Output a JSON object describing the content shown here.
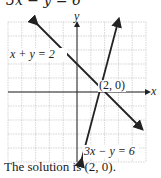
{
  "header": {
    "partial_equation": "3x − y = 6"
  },
  "caption": "The solution is (2, 0).",
  "chart_data": {
    "type": "line",
    "title": "",
    "xlabel": "x",
    "ylabel": "y",
    "xlim": [
      -5,
      5
    ],
    "ylim": [
      -5,
      5
    ],
    "grid": true,
    "series": [
      {
        "name": "x + y = 2",
        "x": [
          -3,
          4.5
        ],
        "y": [
          5,
          -2.5
        ]
      },
      {
        "name": "3x − y = 6",
        "x": [
          0.33,
          3.67
        ],
        "y": [
          -5,
          5
        ]
      }
    ],
    "annotations": [
      {
        "text": "x + y = 2",
        "at": [
          -4.8,
          2.2
        ]
      },
      {
        "text": "(2, 0)",
        "at": [
          2.1,
          0.5
        ]
      },
      {
        "text": "3x − y = 6",
        "at": [
          1.1,
          -4.2
        ]
      }
    ],
    "solution_point": [
      2,
      0
    ]
  }
}
